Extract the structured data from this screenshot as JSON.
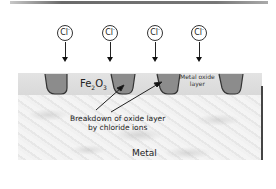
{
  "diagram": {
    "ions": [
      {
        "label": "Cl",
        "charge": "-",
        "x": 65
      },
      {
        "label": "Cl",
        "charge": "-",
        "x": 110
      },
      {
        "label": "Cl",
        "charge": "-",
        "x": 155
      },
      {
        "label": "Cl",
        "charge": "-",
        "x": 199
      }
    ],
    "labels": {
      "oxide_formula_main": "Fe",
      "oxide_formula_sub1": "2",
      "oxide_formula_mid": "O",
      "oxide_formula_sub2": "3",
      "metal_oxide_line1": "Metal oxide",
      "metal_oxide_line2": "layer",
      "breakdown_line1": "Breakdown of oxide layer",
      "breakdown_line2": "by chloride ions",
      "metal": "Metal"
    },
    "colors": {
      "oxide_layer": "#dddddd",
      "pit_fill": "#8c8c8c",
      "pit_stroke": "#333333",
      "metal": "#ececec",
      "lines": "#222222"
    }
  }
}
